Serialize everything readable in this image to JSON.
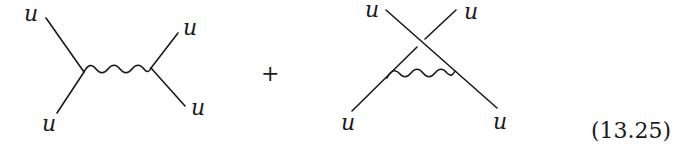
{
  "equation": {
    "number": "(13.25)",
    "operator": "+"
  },
  "diagrams": [
    {
      "name": "s-channel-exchange",
      "labels": [
        {
          "text": "u",
          "position": "top-left"
        },
        {
          "text": "u",
          "position": "bottom-left"
        },
        {
          "text": "u",
          "position": "top-right"
        },
        {
          "text": "u",
          "position": "bottom-right"
        }
      ],
      "propagator": "wavy"
    },
    {
      "name": "crossed-exchange",
      "labels": [
        {
          "text": "u",
          "position": "top-left"
        },
        {
          "text": "u",
          "position": "top-right"
        },
        {
          "text": "u",
          "position": "bottom-left"
        },
        {
          "text": "u",
          "position": "bottom-right"
        }
      ],
      "propagator": "wavy"
    }
  ],
  "colors": {
    "ink": "#1a1a1a",
    "background": "#ffffff"
  }
}
